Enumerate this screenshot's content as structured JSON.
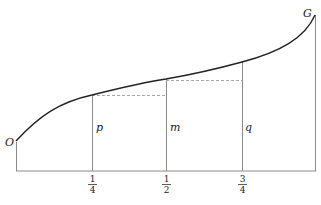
{
  "diagram": {
    "origin_label": "O",
    "end_label": "G",
    "ordinates": [
      {
        "label": "p",
        "tick": {
          "num": "1",
          "den": "4"
        }
      },
      {
        "label": "m",
        "tick": {
          "num": "1",
          "den": "2"
        }
      },
      {
        "label": "q",
        "tick": {
          "num": "3",
          "den": "4"
        }
      }
    ],
    "colors": {
      "curve": "#222222",
      "axis": "#888888",
      "dashed": "#aaaaaa"
    }
  }
}
